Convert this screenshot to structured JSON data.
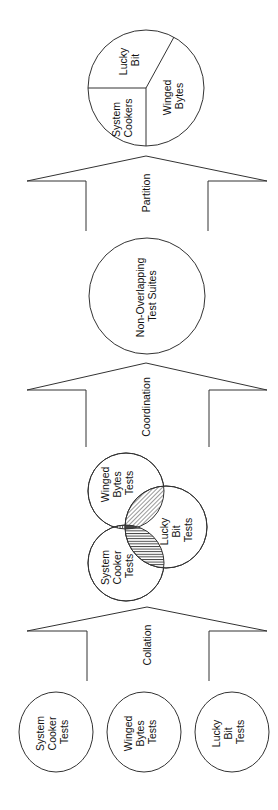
{
  "diagram": {
    "orientation": "rotated-90-ccw",
    "flow": [
      "source_suites",
      "collation",
      "overlapping_venn",
      "coordination",
      "non_overlapping",
      "partition",
      "partitioned_pie"
    ],
    "source_suites": [
      {
        "lines": [
          "System",
          "Cooker",
          "Tests"
        ]
      },
      {
        "lines": [
          "Winged",
          "Bytes",
          "Tests"
        ]
      },
      {
        "lines": [
          "Lucky",
          "Bit",
          "Tests"
        ]
      }
    ],
    "arrows": {
      "collation": "Collation",
      "coordination": "Coordination",
      "partition": "Partition"
    },
    "venn": {
      "circles": [
        {
          "name": "winged-bytes",
          "lines": [
            "Winged",
            "Bytes",
            "Tests"
          ]
        },
        {
          "name": "system-cooker",
          "lines": [
            "System",
            "Cooker",
            "Tests"
          ]
        },
        {
          "name": "lucky-bit",
          "lines": [
            "Lucky",
            "Bit",
            "Tests"
          ]
        }
      ],
      "overlaps": [
        "winged-bytes ∩ system-cooker",
        "winged-bytes ∩ lucky-bit",
        "system-cooker ∩ lucky-bit",
        "all three"
      ]
    },
    "non_overlapping": {
      "lines": [
        "Non-Overlapping",
        "Test Suites"
      ]
    },
    "pie": {
      "slices": [
        {
          "name": "lucky-bit",
          "lines": [
            "Lucky",
            "Bit"
          ]
        },
        {
          "name": "system-cookers",
          "lines": [
            "System",
            "Cookers"
          ]
        },
        {
          "name": "winged-bytes",
          "lines": [
            "Winged",
            "Bytes"
          ]
        }
      ]
    },
    "colors": {
      "stroke": "#333333",
      "background": "#ffffff",
      "text": "#111111"
    }
  }
}
